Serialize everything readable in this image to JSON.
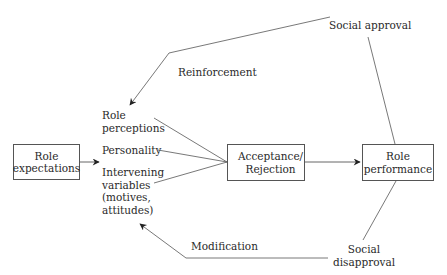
{
  "diagram": {
    "nodes": {
      "role_expectations": "Role\nexpectations",
      "acceptance_rejection": "Acceptance/\nRejection",
      "role_performance": "Role\nperformance"
    },
    "factors": {
      "role_perceptions": "Role\nperceptions",
      "personality": "Personality",
      "intervening_variables": "Intervening\nvariables\n(motives,\nattitudes)"
    },
    "feedback": {
      "social_approval": "Social approval",
      "reinforcement": "Reinforcement",
      "social_disapproval": "Social\ndisapproval",
      "modification": "Modification"
    },
    "colors": {
      "line": "#555555",
      "text": "#2a2a2a",
      "background": "#ffffff"
    }
  }
}
